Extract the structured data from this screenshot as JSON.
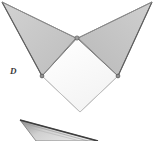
{
  "figure": {
    "label": "D",
    "width": 154,
    "height": 141,
    "background_color": "#ffffff",
    "colors": {
      "shaded_face": "#c9c9c9",
      "shaded_face_right": "#c4c4c4",
      "white_face": "#fafafa",
      "outline": "#4a4a4a",
      "outline_light": "#9a9a9a",
      "vertex_dot": "#555555",
      "wedge_dark": "#4d4d4d",
      "wedge_fill": "#d6d6d6",
      "label_color": "#3a3a3a"
    },
    "shapes": [
      {
        "name": "left-shaded-flap",
        "type": "triangle",
        "fill": "#c9c9c9",
        "points": "2,2 76,38 42,76"
      },
      {
        "name": "right-shaded-flap",
        "type": "triangle",
        "fill": "#c4c4c4",
        "points": "152,2 78,38 118,76"
      },
      {
        "name": "center-white-quad",
        "type": "quadrilateral",
        "fill": "#fafafa",
        "points": "77,38 118,76 80,112 42,76"
      },
      {
        "name": "lower-wedge",
        "type": "thin-triangle",
        "fill": "#d6d6d6",
        "points": "20,120 95,141 38,141"
      }
    ],
    "vertices": [
      {
        "name": "apex-top-left",
        "x": 2,
        "y": 2
      },
      {
        "name": "apex-top-right",
        "x": 152,
        "y": 2
      },
      {
        "name": "vertex-center",
        "x": 77,
        "y": 38
      },
      {
        "name": "vertex-left",
        "x": 42,
        "y": 76
      },
      {
        "name": "vertex-right",
        "x": 118,
        "y": 76
      },
      {
        "name": "vertex-bottom",
        "x": 80,
        "y": 112
      }
    ]
  }
}
